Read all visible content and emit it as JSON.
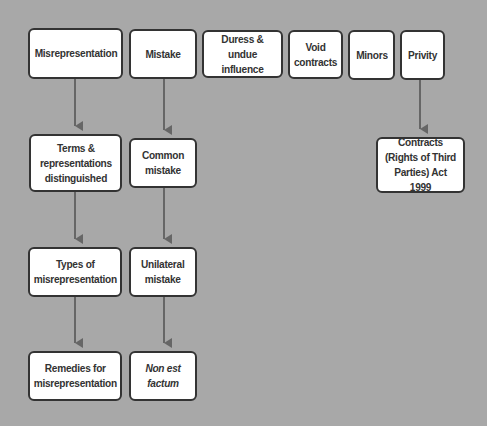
{
  "diagram": {
    "background_color": "#a8a8a8",
    "box_border_color": "#333333",
    "arrow_color": "#666666",
    "top_row": [
      {
        "id": "misrepresentation",
        "label": "Misrepresentation"
      },
      {
        "id": "mistake",
        "label": "Mistake"
      },
      {
        "id": "duress",
        "label": "Duress &\nundue influence"
      },
      {
        "id": "void",
        "label": "Void\ncontracts"
      },
      {
        "id": "minors",
        "label": "Minors"
      },
      {
        "id": "privity",
        "label": "Privity"
      }
    ],
    "misrepresentation_branch": [
      {
        "id": "terms",
        "label": "Terms &\nrepresentations\ndistinguished"
      },
      {
        "id": "types",
        "label": "Types of\nmisrepresentation"
      },
      {
        "id": "remedies",
        "label": "Remedies for\nmisrepresentation"
      }
    ],
    "mistake_branch": [
      {
        "id": "common",
        "label": "Common\nmistake"
      },
      {
        "id": "unilateral",
        "label": "Unilateral\nmistake"
      },
      {
        "id": "non_est",
        "label": "Non est\nfactum",
        "italic": true
      }
    ],
    "privity_branch": [
      {
        "id": "contracts_act",
        "label": "Contracts\n(Rights of Third\nParties) Act 1999"
      }
    ]
  }
}
